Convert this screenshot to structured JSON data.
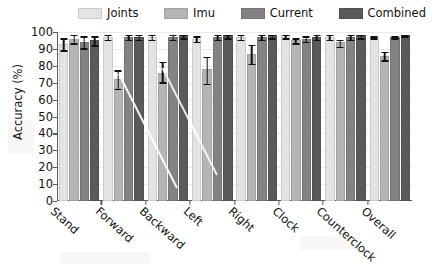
{
  "chart_data": {
    "type": "bar",
    "title": "",
    "xlabel": "",
    "ylabel": "Accuracy (%)",
    "ylim": [
      0,
      100
    ],
    "ytick_step": 10,
    "yticks": [
      100,
      90,
      80,
      70,
      60,
      50,
      40,
      30,
      20,
      10,
      0
    ],
    "grid": true,
    "legend_position": "top",
    "categories": [
      "Stand",
      "Forward",
      "Backward",
      "Left",
      "Right",
      "Clock",
      "Counterclock",
      "Overall"
    ],
    "series": [
      {
        "name": "Joints",
        "color": "#e3e3e3",
        "values": [
          93,
          97,
          97,
          96,
          97,
          98,
          97,
          97
        ],
        "err_low": [
          89,
          95,
          95,
          94,
          95,
          96,
          95,
          96
        ],
        "err_high": [
          97,
          99,
          99,
          98,
          99,
          99,
          99,
          98
        ]
      },
      {
        "name": "Imu",
        "color": "#b5b5b5",
        "values": [
          96,
          72,
          76,
          78,
          87,
          95,
          94,
          86
        ],
        "err_low": [
          93,
          66,
          70,
          69,
          81,
          93,
          91,
          83
        ],
        "err_high": [
          99,
          78,
          83,
          86,
          93,
          97,
          96,
          89
        ]
      },
      {
        "name": "Current",
        "color": "#838383",
        "values": [
          94,
          97,
          97,
          97,
          97,
          96,
          97,
          97
        ],
        "err_low": [
          90,
          95,
          95,
          95,
          95,
          94,
          95,
          96
        ],
        "err_high": [
          98,
          99,
          99,
          99,
          99,
          98,
          99,
          98
        ]
      },
      {
        "name": "Combined",
        "color": "#5a5a5a",
        "values": [
          95,
          97,
          98,
          98,
          98,
          97,
          98,
          98
        ],
        "err_low": [
          92,
          95,
          96,
          96,
          96,
          95,
          96,
          97
        ],
        "err_high": [
          98,
          99,
          99,
          99,
          99,
          99,
          99,
          99
        ]
      }
    ]
  },
  "legend": {
    "items": [
      {
        "label": "Joints",
        "color": "#e3e3e3"
      },
      {
        "label": "Imu",
        "color": "#b5b5b5"
      },
      {
        "label": "Current",
        "color": "#838383"
      },
      {
        "label": "Combined",
        "color": "#5a5a5a"
      }
    ]
  },
  "axes": {
    "y_title": "Accuracy (%)"
  }
}
